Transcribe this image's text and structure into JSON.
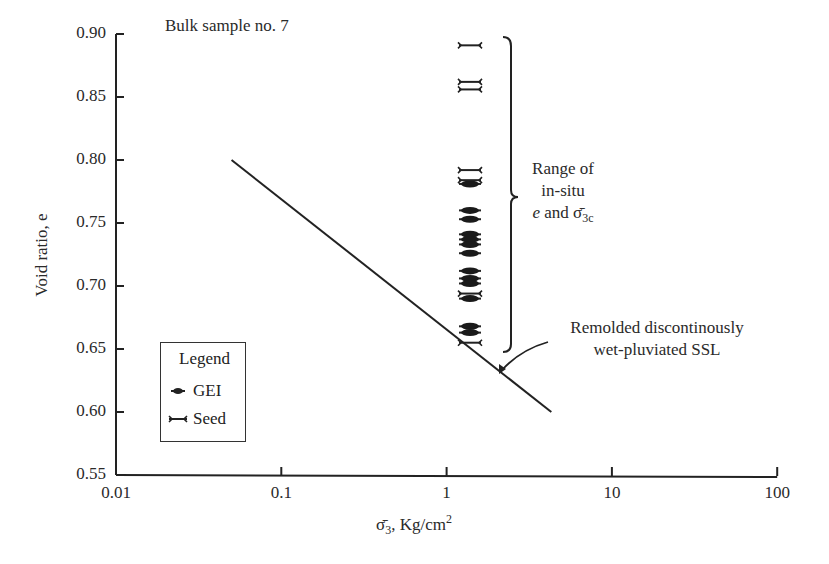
{
  "chart_data": {
    "type": "scatter",
    "title": "Bulk sample no. 7",
    "xlabel": "σ̄3, Kg/cm²",
    "ylabel": "Void ratio, e",
    "xscale": "log",
    "xlim": [
      0.01,
      100
    ],
    "ylim": [
      0.55,
      0.9
    ],
    "x_ticks": [
      "0.01",
      "0.1",
      "1",
      "10",
      "100"
    ],
    "y_ticks": [
      "0.90",
      "0.85",
      "0.80",
      "0.75",
      "0.70",
      "0.65",
      "0.60",
      "0.55"
    ],
    "grid": false,
    "legend": {
      "title": "Legend",
      "position": "lower-left",
      "entries": [
        "GEI",
        "Seed"
      ]
    },
    "series": [
      {
        "name": "Remolded discontinously wet-pluviated SSL",
        "kind": "line",
        "x": [
          0.05,
          4.3
        ],
        "y": [
          0.8,
          0.6
        ]
      },
      {
        "name": "GEI",
        "kind": "marker",
        "x": [
          1.45,
          1.45,
          1.45,
          1.45,
          1.45,
          1.45,
          1.45,
          1.45,
          1.45,
          1.45,
          1.45,
          1.45,
          1.45
        ],
        "y": [
          0.781,
          0.76,
          0.753,
          0.741,
          0.737,
          0.733,
          0.726,
          0.712,
          0.706,
          0.702,
          0.69,
          0.668,
          0.663
        ]
      },
      {
        "name": "Seed",
        "kind": "marker",
        "x": [
          1.45,
          1.45,
          1.45,
          1.45,
          1.45,
          1.45,
          1.45
        ],
        "y": [
          0.891,
          0.862,
          0.856,
          0.792,
          0.784,
          0.694,
          0.655
        ]
      }
    ],
    "annotations": [
      {
        "text": "Range of in-situ e and σ̄3c",
        "type": "brace",
        "y_range": [
          0.655,
          0.895
        ]
      },
      {
        "text": "Remolded discontinously wet-pluviated SSL",
        "type": "arrow-label"
      }
    ]
  },
  "labels": {
    "title": "Bulk sample no. 7",
    "ylabel": "Void ratio, e",
    "xlabel_main": "σ̄",
    "xlabel_sub": "3",
    "xlabel_rest": ", Kg/cm",
    "xlabel_sup": "2",
    "range_line1": "Range of",
    "range_line2": "in-situ",
    "range_line3_e": "e",
    "range_line3_rest": " and σ̄",
    "range_line3_sub": "3c",
    "ssl_line1": "Remolded discontinously",
    "ssl_line2": "wet-pluviated SSL",
    "legend_title": "Legend",
    "legend_gei": "GEI",
    "legend_seed": "Seed"
  },
  "ticks": {
    "y": [
      "0.90",
      "0.85",
      "0.80",
      "0.75",
      "0.70",
      "0.65",
      "0.60",
      "0.55"
    ],
    "x": [
      "0.01",
      "0.1",
      "1",
      "10",
      "100"
    ]
  }
}
